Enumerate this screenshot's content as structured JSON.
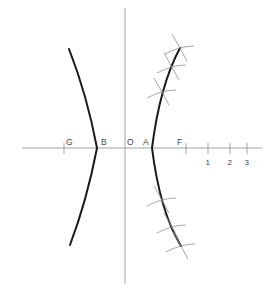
{
  "diagram": {
    "type": "hyperbola-construction",
    "axes": {
      "horizontal": {
        "x1": 22,
        "x2": 262,
        "y": 148
      },
      "vertical": {
        "x": 125,
        "y1": 8,
        "y2": 284
      }
    },
    "point_labels": [
      {
        "id": "G",
        "text": "G",
        "x": 66,
        "y": 145
      },
      {
        "id": "B",
        "text": "B",
        "x": 101,
        "y": 145
      },
      {
        "id": "O",
        "text": "O",
        "x": 127,
        "y": 145
      },
      {
        "id": "A",
        "text": "A",
        "x": 143,
        "y": 145
      },
      {
        "id": "F",
        "text": "F",
        "x": 177,
        "y": 145
      }
    ],
    "scale_ticks": [
      {
        "label": "",
        "x": 64
      },
      {
        "label": "",
        "x": 186
      },
      {
        "label": "1",
        "x": 208
      },
      {
        "label": "2",
        "x": 230
      },
      {
        "label": "3",
        "x": 247
      }
    ],
    "branches": {
      "left": "M69,49 Q87,95 97,148 Q87,200 70,245",
      "right": "M180,48 Q160,85 152,148 Q160,212 181,246"
    },
    "construction_points": [
      {
        "x": 180,
        "y": 48
      },
      {
        "x": 172,
        "y": 67
      },
      {
        "x": 162,
        "y": 92
      },
      {
        "x": 162,
        "y": 200
      },
      {
        "x": 172,
        "y": 227
      },
      {
        "x": 181,
        "y": 246
      }
    ],
    "colors": {
      "curve": "#1a1a1a",
      "axis": "#8a8a8a",
      "construction": "#8f8f8f",
      "label": "#444444",
      "background": "#ffffff"
    }
  }
}
